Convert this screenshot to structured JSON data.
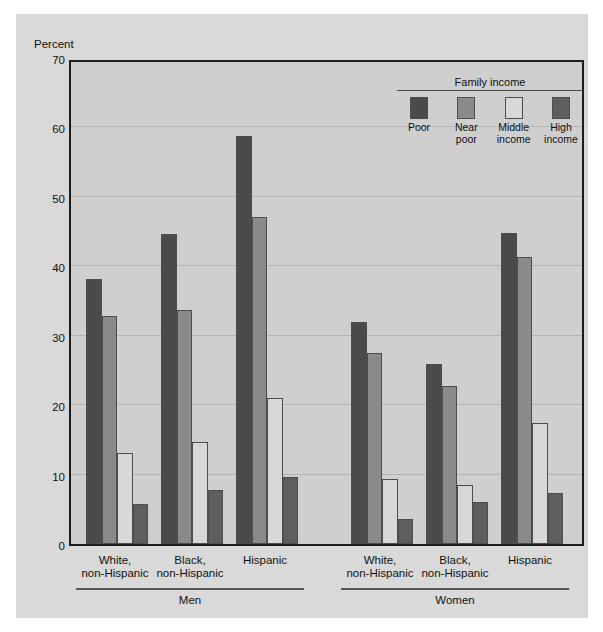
{
  "chart_data": {
    "type": "bar",
    "title": "",
    "xlabel": "",
    "ylabel": "Percent",
    "ylim": [
      0,
      70
    ],
    "yticks": [
      0,
      10,
      20,
      30,
      40,
      50,
      60,
      70
    ],
    "grid": true,
    "legend_position": "top-right",
    "legend_title": "Family income",
    "series": [
      {
        "name": "Poor",
        "color": "#4a4a4a",
        "values": [
          38.2,
          44.6,
          58.8,
          32.0,
          25.9,
          44.8
        ]
      },
      {
        "name": "Near poor",
        "color": "#8a8a8a",
        "values": [
          32.9,
          33.7,
          47.1,
          27.5,
          22.7,
          41.4
        ]
      },
      {
        "name": "Middle income",
        "color": "#d8d8d8",
        "values": [
          13.1,
          14.7,
          21.0,
          9.4,
          8.5,
          17.4
        ]
      },
      {
        "name": "High income",
        "color": "#5e5e5e",
        "values": [
          5.7,
          7.8,
          9.7,
          3.6,
          6.0,
          7.3
        ]
      }
    ],
    "categories": [
      "White,\nnon-Hispanic",
      "Black,\nnon-Hispanic",
      "Hispanic",
      "White,\nnon-Hispanic",
      "Black,\nnon-Hispanic",
      "Hispanic"
    ],
    "supergroups": [
      {
        "label": "Men",
        "categories": [
          0,
          1,
          2
        ]
      },
      {
        "label": "Women",
        "categories": [
          3,
          4,
          5
        ]
      }
    ]
  },
  "axis": {
    "y_axis_title": "Percent"
  },
  "legend": {
    "title": "Family income",
    "items": [
      {
        "label": "Poor",
        "color": "#4a4a4a"
      },
      {
        "label": "Near\npoor",
        "color": "#8a8a8a"
      },
      {
        "label": "Middle\nincome",
        "color": "#d8d8d8"
      },
      {
        "label": "High\nincome",
        "color": "#5e5e5e"
      }
    ]
  }
}
